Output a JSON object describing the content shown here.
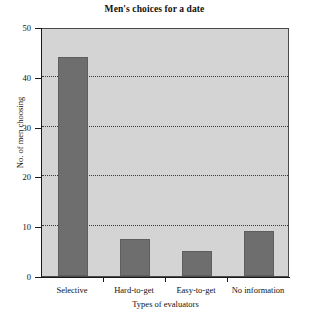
{
  "chart_data": {
    "type": "bar",
    "title": "Men's choices for a date",
    "xlabel": "Types of evaluators",
    "ylabel": "No. of men choosing",
    "categories": [
      "Selective",
      "Hard-to-get",
      "Easy-to-get",
      "No information"
    ],
    "values": [
      44,
      7.5,
      5,
      9
    ],
    "ylim": [
      0,
      50
    ],
    "ytick_labels": [
      "0",
      "10",
      "20",
      "30",
      "40",
      "50"
    ],
    "ytick_values": [
      0,
      10,
      20,
      30,
      40,
      50
    ],
    "grid": "horizontal-dotted",
    "legend": "none",
    "colors": {
      "bar_fill": "#6e6e6e",
      "bar_edge": "#5e5e5e",
      "plot_background": "#d4d4d4",
      "axis": "#1a1a1a",
      "gridline": "#3a3a3a",
      "figure_background": "#ffffff",
      "text": "#111111"
    }
  }
}
